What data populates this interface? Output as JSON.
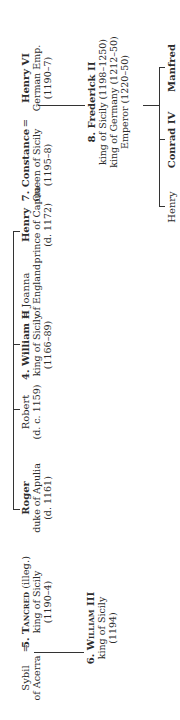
{
  "diagram": {
    "type": "genealogy",
    "orientation": "rotated-90-ccw",
    "generation1_siblings": [
      {
        "id": "roger",
        "name": "Roger",
        "bold": true,
        "lines": [
          "duke of Apulia",
          "(d. 1161)"
        ]
      },
      {
        "id": "robert",
        "name": "Robert",
        "bold": false,
        "lines": [
          "(d. c. 1159)"
        ]
      },
      {
        "id": "william2",
        "name": "4. William II",
        "bold": true,
        "lines": [
          "king of Sicily",
          "(1166–89)"
        ]
      },
      {
        "id": "henry_capua",
        "name": "Henry",
        "bold": true,
        "lines": [
          "prince of Capua",
          "(d. 1172)"
        ]
      }
    ],
    "spouses": {
      "joanna": {
        "name": "Joanna",
        "lines": [
          "of England"
        ]
      },
      "sybil": {
        "name": "Sybil",
        "lines": [
          "of Acerra"
        ]
      },
      "henry6": {
        "name": "Henry VI",
        "lines": [
          "German Emp.",
          "(1190–7)"
        ]
      }
    },
    "constance": {
      "name": "7. Constance",
      "lines": [
        "Queen of Sicily",
        "(1195–8)"
      ]
    },
    "tancred": {
      "number": "5.",
      "name": "Tancred",
      "suffix": " (illeg.)",
      "lines": [
        "king of Sicily",
        "(1190–4)"
      ]
    },
    "william3": {
      "number": "6.",
      "name": "William III",
      "lines": [
        "king of Sicily",
        "(1194)"
      ]
    },
    "frederick2": {
      "name": "8. Frederick II",
      "lines": [
        "king of Sicily (1198–1250)",
        "king of Germany (1212–50)",
        "Emperor (1220–50)"
      ]
    },
    "frederick_children": [
      {
        "id": "henry_son",
        "name": "Henry",
        "bold": false
      },
      {
        "id": "conrad4",
        "name": "Conrad IV",
        "bold": true
      },
      {
        "id": "manfred",
        "name": "Manfred",
        "bold": true
      }
    ],
    "marriage_symbol": "="
  }
}
